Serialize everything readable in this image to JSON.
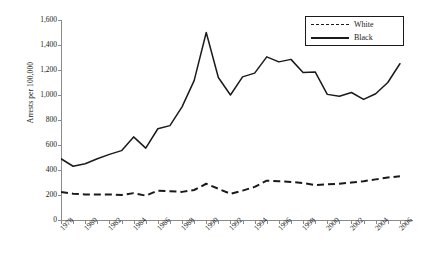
{
  "chart_data": {
    "type": "line",
    "title": "",
    "xlabel": "",
    "ylabel": "Arrests per 100,000",
    "xlim": [
      1978,
      2007
    ],
    "ylim": [
      0,
      1600
    ],
    "ytick_step": 200,
    "grid": false,
    "legend_position": "top-right",
    "ytick_labels": [
      "1,600",
      "1,400",
      "1,200",
      "1,000",
      "800",
      "600",
      "400",
      "200",
      "0"
    ],
    "ytick_values": [
      1600,
      1400,
      1200,
      1000,
      800,
      600,
      400,
      200,
      0
    ],
    "xtick_labels": [
      "1978",
      "1980",
      "1982",
      "1984",
      "1986",
      "1988",
      "1990",
      "1992",
      "1994",
      "1996",
      "1998",
      "2000",
      "2002",
      "2004",
      "2006"
    ],
    "xtick_values": [
      1978,
      1980,
      1982,
      1984,
      1986,
      1988,
      1990,
      1992,
      1994,
      1996,
      1998,
      2000,
      2002,
      2004,
      2006
    ],
    "x": [
      1978,
      1979,
      1980,
      1981,
      1982,
      1983,
      1984,
      1985,
      1986,
      1987,
      1988,
      1989,
      1990,
      1991,
      1992,
      1993,
      1994,
      1995,
      1996,
      1997,
      1998,
      1999,
      2000,
      2001,
      2002,
      2003,
      2004,
      2005,
      2006
    ],
    "series": [
      {
        "name": "White",
        "style": "dashed",
        "color": "#1a1a1a",
        "values": [
          225,
          210,
          205,
          205,
          205,
          200,
          215,
          195,
          235,
          230,
          225,
          240,
          290,
          250,
          210,
          235,
          265,
          315,
          310,
          305,
          295,
          280,
          285,
          290,
          300,
          310,
          325,
          340,
          350
        ]
      },
      {
        "name": "Black",
        "style": "solid",
        "color": "#1a1a1a",
        "values": [
          490,
          430,
          450,
          490,
          525,
          555,
          665,
          575,
          730,
          755,
          905,
          1115,
          1500,
          1140,
          1000,
          1145,
          1175,
          1305,
          1265,
          1285,
          1180,
          1185,
          1005,
          990,
          1020,
          965,
          1010,
          1100,
          1250
        ]
      }
    ]
  },
  "legend": {
    "entries": [
      {
        "label": "White",
        "style": "dashed"
      },
      {
        "label": "Black",
        "style": "solid"
      }
    ]
  }
}
